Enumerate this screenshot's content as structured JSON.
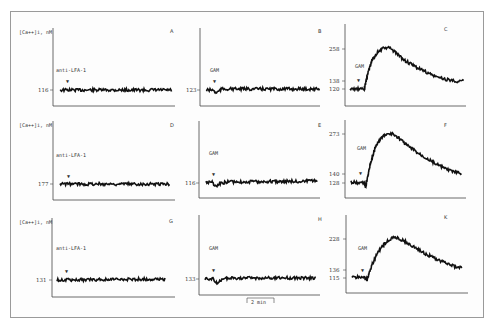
{
  "figure": {
    "y_axis_label": "[Ca++]i, nM",
    "scale_bar_label": "2 min",
    "stimulus_marker": "▼"
  },
  "chart_data": {
    "type": "line",
    "title": "",
    "layout": "3x3 grid of calcium traces",
    "ylabel": "[Ca++]i, nM",
    "xlabel": "time (scale bar: 2 min)",
    "grid": false,
    "panels": [
      {
        "id": "A",
        "row": 0,
        "col": 0,
        "stimulus": "anti-LFA-1",
        "baseline": 116,
        "peak": null,
        "plateau": null,
        "response": "flat"
      },
      {
        "id": "B",
        "row": 0,
        "col": 1,
        "stimulus": "GAM",
        "baseline": 123,
        "peak": null,
        "plateau": null,
        "response": "flat"
      },
      {
        "id": "C",
        "row": 0,
        "col": 2,
        "stimulus": "GAM",
        "baseline": 120,
        "peak": 258,
        "plateau": 138,
        "response": "rise-decay"
      },
      {
        "id": "D",
        "row": 1,
        "col": 0,
        "stimulus": "anti-LFA-1",
        "baseline": 177,
        "peak": null,
        "plateau": null,
        "response": "flat"
      },
      {
        "id": "E",
        "row": 1,
        "col": 1,
        "stimulus": "GAM",
        "baseline": 116,
        "peak": null,
        "plateau": null,
        "response": "flat"
      },
      {
        "id": "F",
        "row": 1,
        "col": 2,
        "stimulus": "GAM",
        "baseline": 128,
        "peak": 273,
        "plateau": 140,
        "response": "rise-decay"
      },
      {
        "id": "G",
        "row": 2,
        "col": 0,
        "stimulus": "anti-LFA-1",
        "baseline": 131,
        "peak": null,
        "plateau": null,
        "response": "flat"
      },
      {
        "id": "H",
        "row": 2,
        "col": 1,
        "stimulus": "GAM",
        "baseline": 133,
        "peak": null,
        "plateau": null,
        "response": "flat"
      },
      {
        "id": "K",
        "row": 2,
        "col": 2,
        "stimulus": "GAM",
        "baseline": 115,
        "peak": 228,
        "plateau": 136,
        "response": "rise-decay"
      }
    ]
  }
}
